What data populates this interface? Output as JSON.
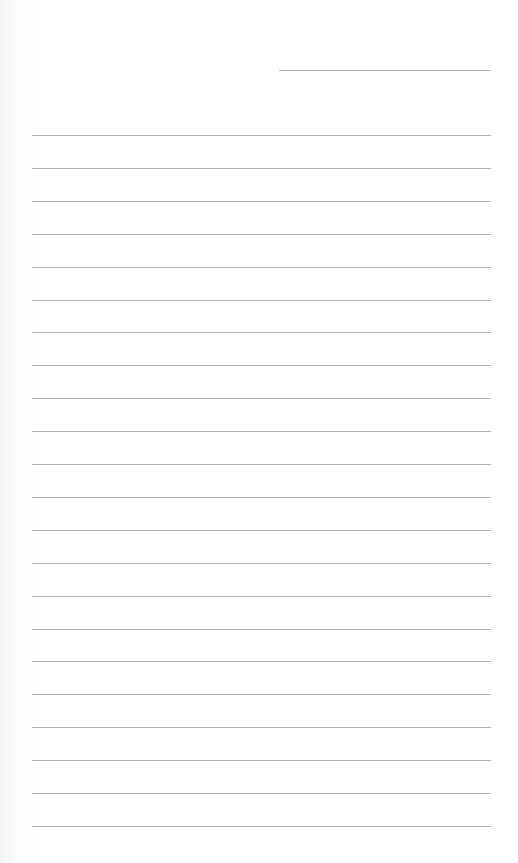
{
  "page": {
    "type": "lined-paper",
    "background": "#ffffff",
    "line_color": "#9a9a9a",
    "header_line": {
      "x": 279,
      "y": 70,
      "width": 212
    },
    "rules": {
      "count": 22,
      "x": 32,
      "width": 459,
      "first_y": 135,
      "spacing": 32.9
    }
  }
}
